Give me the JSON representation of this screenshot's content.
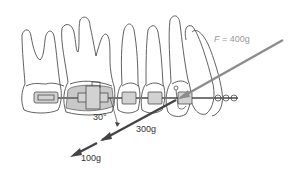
{
  "diagram": {
    "colors": {
      "outline": "#3a3a3a",
      "band_fill": "#c8c8c8",
      "wire": "#777777",
      "applied_force": "#8c8c8c",
      "component_force": "#444444"
    },
    "labels": {
      "applied_force_var": "F",
      "applied_force_eq": " = 400g",
      "angle": "30°",
      "component_1": "300g",
      "component_2": "100g"
    },
    "forces": [
      {
        "name": "applied",
        "value": "400g"
      },
      {
        "name": "component-1",
        "value": "300g"
      },
      {
        "name": "component-2",
        "value": "100g"
      }
    ],
    "angle_deg": 30
  }
}
